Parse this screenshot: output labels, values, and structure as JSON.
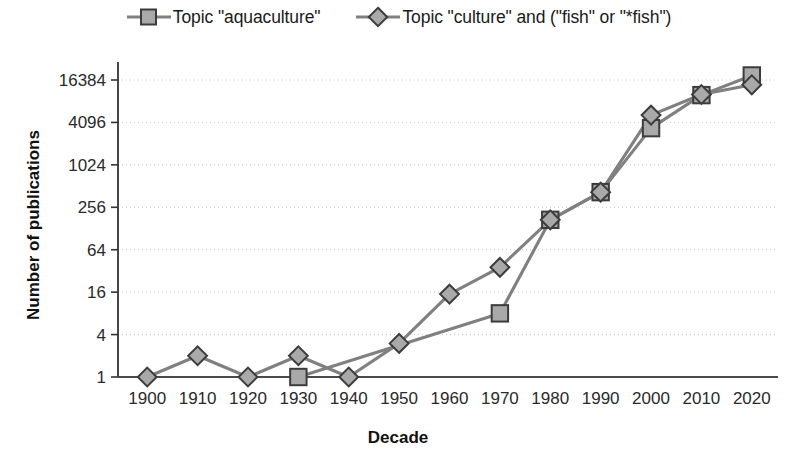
{
  "chart_data": {
    "type": "line",
    "title": "",
    "xlabel": "Decade",
    "ylabel": "Number of publications",
    "categories": [
      1900,
      1910,
      1920,
      1930,
      1940,
      1950,
      1960,
      1970,
      1980,
      1990,
      2000,
      2010,
      2020
    ],
    "x_tick_labels": [
      "1900",
      "1910",
      "1920",
      "1930",
      "1940",
      "1950",
      "1960",
      "1970",
      "1980",
      "1990",
      "2000",
      "2010",
      "2020"
    ],
    "y_tick_labels": [
      "1",
      "4",
      "16",
      "64",
      "256",
      "1024",
      "4096",
      "16384"
    ],
    "y_tick_values": [
      1,
      4,
      16,
      64,
      256,
      1024,
      4096,
      16384
    ],
    "y_scale": "log4",
    "ylim": [
      1,
      16384
    ],
    "grid": "horizontal-dotted",
    "legend_position": "top-center",
    "series": [
      {
        "name": "Topic \"aquaculture\"",
        "marker": "square",
        "color": "#808080",
        "marker_fill": "#a9a9a9",
        "marker_stroke": "#3c3c3c",
        "x": [
          1930,
          1970,
          1980,
          1990,
          2000,
          2010,
          2020
        ],
        "values": [
          1,
          8,
          170,
          420,
          3400,
          10000,
          19000
        ]
      },
      {
        "name": "Topic \"culture\" and (\"fish\" or \"*fish\")",
        "marker": "diamond",
        "color": "#808080",
        "marker_fill": "#a9a9a9",
        "marker_stroke": "#3c3c3c",
        "x": [
          1900,
          1910,
          1920,
          1930,
          1940,
          1950,
          1960,
          1970,
          1980,
          1990,
          2000,
          2010,
          2020
        ],
        "values": [
          1,
          2,
          1,
          2,
          1,
          3,
          15,
          36,
          170,
          420,
          5200,
          10200,
          14000
        ]
      }
    ]
  },
  "legend": {
    "items": [
      {
        "label": "Topic \"aquaculture\"",
        "marker": "square"
      },
      {
        "label": "Topic \"culture\" and (\"fish\" or \"*fish\")",
        "marker": "diamond"
      }
    ]
  },
  "axes": {
    "x_title": "Decade",
    "y_title": "Number of publications"
  },
  "colors": {
    "line": "#808080",
    "marker_fill": "#a9a9a9",
    "marker_stroke": "#3c3c3c",
    "axis": "#333333",
    "grid": "#cccccc",
    "text": "#1a1a1a"
  }
}
